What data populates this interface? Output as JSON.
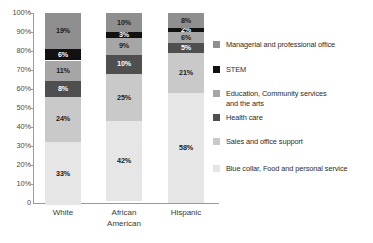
{
  "chart_data": {
    "type": "bar",
    "subtype": "stacked-bar-100-percent",
    "title": "",
    "xlabel": "",
    "ylabel": "",
    "ylim": [
      0,
      100
    ],
    "grid": false,
    "legend_position": "right",
    "categories": [
      "White",
      "African American",
      "Hispanic"
    ],
    "category_lines": [
      [
        "White"
      ],
      [
        "African",
        "American"
      ],
      [
        "Hispanic"
      ]
    ],
    "y_ticks": [
      "100%",
      "90%",
      "80%",
      "70%",
      "60%",
      "50%",
      "40%",
      "30%",
      "20%",
      "10%",
      "0"
    ],
    "y_tick_values": [
      100,
      90,
      80,
      70,
      60,
      50,
      40,
      30,
      20,
      10,
      0
    ],
    "stack_order_bottom_to_top": [
      "Blue collar, Food and personal service",
      "Sales and office support",
      "Health care",
      "Education, Community services and the arts",
      "STEM",
      "Managerial and professional office"
    ],
    "series": [
      {
        "name": "Managerial and professional office",
        "color": "#8f8f8f",
        "label_color": "dark",
        "values": [
          19,
          10,
          8
        ],
        "labels": [
          "19%",
          "10%",
          "8%"
        ]
      },
      {
        "name": "STEM",
        "color": "#111111",
        "label_color": "light",
        "values": [
          6,
          3,
          2
        ],
        "labels": [
          "6%",
          "3%",
          "2%"
        ]
      },
      {
        "name": "Education, Community services and the arts",
        "color": "#a6a6a6",
        "label_color": "dark",
        "values": [
          11,
          9,
          6
        ],
        "labels": [
          "11%",
          "9%",
          "6%"
        ]
      },
      {
        "name": "Health care",
        "color": "#4f4f4f",
        "label_color": "light",
        "values": [
          8,
          10,
          5
        ],
        "labels": [
          "8%",
          "10%",
          "5%"
        ]
      },
      {
        "name": "Sales and office support",
        "color": "#c9c9c9",
        "label_color": "dark",
        "values": [
          24,
          25,
          21
        ],
        "labels": [
          "24%",
          "25%",
          "21%"
        ]
      },
      {
        "name": "Blue collar, Food and personal service",
        "color": "#e6e6e6",
        "label_color": "dark",
        "values": [
          33,
          42,
          58
        ],
        "labels": [
          "33%",
          "42%",
          "58%"
        ]
      }
    ]
  },
  "legend": {
    "items": [
      {
        "label": "Managerial and professional office",
        "color": "#8f8f8f"
      },
      {
        "label": "STEM",
        "color": "#111111"
      },
      {
        "label": "Education, Community services\nand the arts",
        "color": "#a6a6a6"
      },
      {
        "label": "Health care",
        "color": "#4f4f4f"
      },
      {
        "label": "Sales and office support",
        "color": "#c9c9c9"
      },
      {
        "label": "Blue collar, Food and personal service",
        "color": "#e6e6e6"
      }
    ]
  },
  "axis": {
    "line_color": "#9a9a9a",
    "tick_label_color": "#4a4a4a"
  }
}
